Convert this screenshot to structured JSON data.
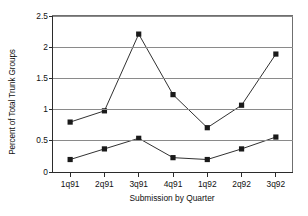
{
  "chart_data": {
    "type": "line",
    "title": "",
    "subtitle": "",
    "xlabel": "Submission by Quarter",
    "ylabel": "Percent of Total Trunk Groups",
    "categories": [
      "1q91",
      "2q91",
      "3q91",
      "4q91",
      "1q92",
      "2q92",
      "3q92"
    ],
    "ylim": [
      0,
      2.5
    ],
    "yticks": [
      "0",
      "0.5",
      "1",
      "1.5",
      "2",
      "2.5"
    ],
    "ytick_values": [
      0,
      0.5,
      1,
      1.5,
      2,
      2.5
    ],
    "grid": "horizontal",
    "legend": "none",
    "marker": "filled-square",
    "series": [
      {
        "name": "upper-series",
        "values": [
          0.8,
          0.98,
          2.21,
          1.24,
          0.71,
          1.07,
          1.89
        ],
        "color": "#1a1a1a"
      },
      {
        "name": "lower-series",
        "values": [
          0.2,
          0.37,
          0.54,
          0.23,
          0.2,
          0.37,
          0.56
        ],
        "color": "#1a1a1a"
      }
    ]
  },
  "axes": {
    "line_color": "#2b2b2b",
    "grid_color": "#8a8a8a"
  }
}
